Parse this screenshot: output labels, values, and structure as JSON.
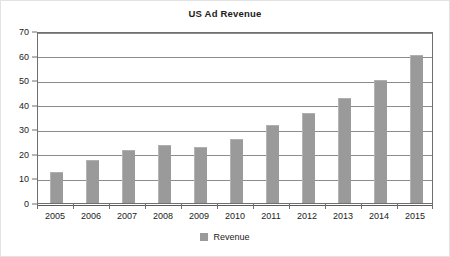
{
  "chart_data": {
    "type": "bar",
    "title": "US Ad Revenue",
    "xlabel": "",
    "ylabel": "",
    "ylim": [
      0,
      70
    ],
    "yticks": [
      0,
      10,
      20,
      30,
      40,
      50,
      60,
      70
    ],
    "grid": true,
    "legend_position": "bottom",
    "categories": [
      "2005",
      "2006",
      "2007",
      "2008",
      "2009",
      "2010",
      "2011",
      "2012",
      "2013",
      "2014",
      "2015"
    ],
    "series": [
      {
        "name": "Revenue",
        "color": "#9a9a9a",
        "values": [
          12.3,
          16.9,
          21.0,
          23.3,
          22.5,
          25.5,
          31.3,
          36.3,
          42.4,
          49.6,
          59.8
        ]
      }
    ]
  },
  "legend": {
    "items": [
      {
        "label": "Revenue",
        "swatch": "legend-swatch-revenue"
      }
    ]
  },
  "colors": {
    "bar": "#9a9a9a",
    "axis": "#6f6f6f",
    "grid": "#8c8c8c",
    "text": "#1c1c1c",
    "background": "#ffffff"
  }
}
